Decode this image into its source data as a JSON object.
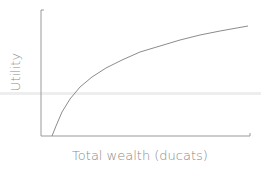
{
  "chart_data": {
    "type": "line",
    "title": "",
    "xlabel": "Total wealth (ducats)",
    "ylabel": "Utility",
    "x_ticks": [],
    "y_ticks": [],
    "grid": false,
    "legend": null,
    "series": [
      {
        "name": "Utility of wealth (logarithmic, concave)",
        "shape": "log",
        "points_px": [
          [
            52,
            136
          ],
          [
            56,
            126
          ],
          [
            62,
            112
          ],
          [
            70,
            99
          ],
          [
            80,
            87
          ],
          [
            92,
            77
          ],
          [
            106,
            68
          ],
          [
            122,
            60
          ],
          [
            140,
            52
          ],
          [
            160,
            46
          ],
          [
            180,
            40
          ],
          [
            200,
            35
          ],
          [
            220,
            31
          ],
          [
            248,
            26
          ]
        ]
      }
    ],
    "axes_px": {
      "origin": [
        41,
        136
      ],
      "x_end": [
        250,
        136
      ],
      "y_top": [
        41,
        10
      ]
    },
    "colors": {
      "axis": "#9a9a9a",
      "curve": "#8c8c8c",
      "label": "#8a8a8a",
      "band": "#ececec"
    },
    "annotations": []
  }
}
